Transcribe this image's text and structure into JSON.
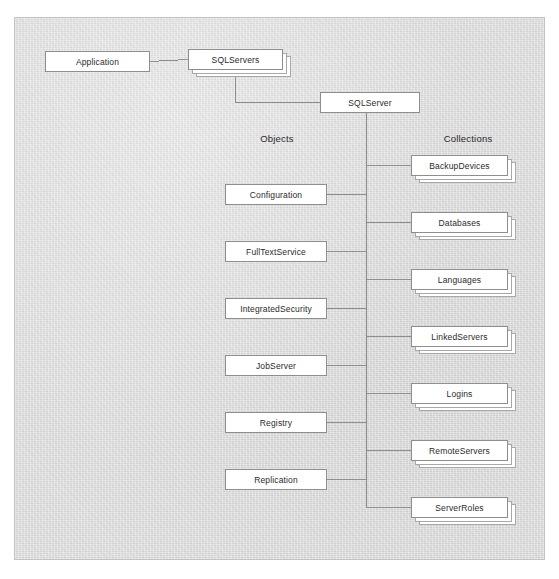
{
  "diagram": {
    "frame": {
      "x": 14,
      "y": 17,
      "width": 531,
      "height": 543,
      "background": "#dcdcdc",
      "border": "#c2c2c2"
    },
    "line_color": "#8e8e8e",
    "box_fill": "#ffffff",
    "box_border": "#8e8e8e"
  },
  "headings": {
    "objects": "Objects",
    "collections": "Collections"
  },
  "top_nodes": [
    {
      "id": "application",
      "label": "Application",
      "x": 45,
      "y": 51,
      "w": 105,
      "h": 21,
      "stacked": false
    },
    {
      "id": "sqlservers",
      "label": "SQLServers",
      "x": 188,
      "y": 49,
      "w": 95,
      "h": 21,
      "stacked": true
    },
    {
      "id": "sqlserver",
      "label": "SQLServer",
      "x": 320,
      "y": 92,
      "w": 100,
      "h": 21,
      "stacked": false
    }
  ],
  "objects": [
    {
      "id": "configuration",
      "label": "Configuration",
      "x": 225,
      "y": 184,
      "w": 102,
      "h": 21
    },
    {
      "id": "fulltextservice",
      "label": "FullTextService",
      "x": 225,
      "y": 241,
      "w": 102,
      "h": 21
    },
    {
      "id": "integratedsecurity",
      "label": "IntegratedSecurity",
      "x": 225,
      "y": 298,
      "w": 102,
      "h": 21
    },
    {
      "id": "jobserver",
      "label": "JobServer",
      "x": 225,
      "y": 355,
      "w": 102,
      "h": 21
    },
    {
      "id": "registry",
      "label": "Registry",
      "x": 225,
      "y": 412,
      "w": 102,
      "h": 21
    },
    {
      "id": "replication",
      "label": "Replication",
      "x": 225,
      "y": 469,
      "w": 102,
      "h": 21
    }
  ],
  "collections": [
    {
      "id": "backupdevices",
      "label": "BackupDevices",
      "x": 411,
      "y": 155,
      "w": 97,
      "h": 21
    },
    {
      "id": "databases",
      "label": "Databases",
      "x": 411,
      "y": 212,
      "w": 97,
      "h": 21
    },
    {
      "id": "languages",
      "label": "Languages",
      "x": 411,
      "y": 269,
      "w": 97,
      "h": 21
    },
    {
      "id": "linkedservers",
      "label": "LinkedServers",
      "x": 411,
      "y": 326,
      "w": 97,
      "h": 21
    },
    {
      "id": "logins",
      "label": "Logins",
      "x": 411,
      "y": 383,
      "w": 97,
      "h": 21
    },
    {
      "id": "remoteservers",
      "label": "RemoteServers",
      "x": 411,
      "y": 440,
      "w": 97,
      "h": 21
    },
    {
      "id": "serverroles",
      "label": "ServerRoles",
      "x": 411,
      "y": 497,
      "w": 97,
      "h": 21
    }
  ],
  "layout": {
    "objects_heading_x": 277,
    "collections_heading_x": 468,
    "heading_y": 133,
    "trunk_x": 366,
    "trunk_top": 113,
    "trunk_bottom": 507
  }
}
